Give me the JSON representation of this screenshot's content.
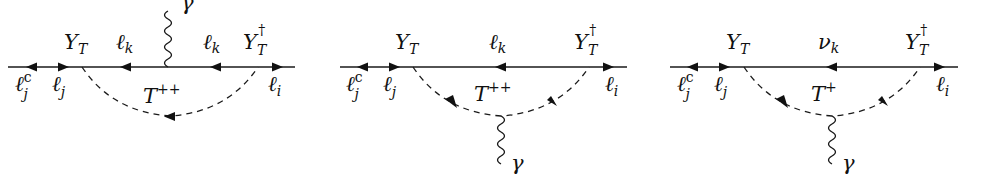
{
  "figure": {
    "colors": {
      "ink": "#111111",
      "background": "#ffffff"
    },
    "diagrams": [
      {
        "id": "diagram-1",
        "external_left_outer": {
          "base": "ℓ",
          "sup": "c",
          "sub": "j"
        },
        "external_left_inner": {
          "base": "ℓ",
          "sub": "j"
        },
        "external_right": {
          "base": "ℓ",
          "sub": "i"
        },
        "vertex_left": {
          "base": "Y",
          "sub": "T"
        },
        "vertex_right": {
          "base": "Y",
          "sub": "T",
          "sup": "†"
        },
        "internal_fermion_left": {
          "base": "ℓ",
          "sub": "k"
        },
        "internal_fermion_right": {
          "base": "ℓ",
          "sub": "k"
        },
        "scalar": {
          "base": "T",
          "sup": "++"
        },
        "photon": {
          "label": "γ",
          "attached_to": "internal fermion line (top)"
        }
      },
      {
        "id": "diagram-2",
        "external_left_outer": {
          "base": "ℓ",
          "sup": "c",
          "sub": "j"
        },
        "external_left_inner": {
          "base": "ℓ",
          "sub": "j"
        },
        "external_right": {
          "base": "ℓ",
          "sub": "i"
        },
        "vertex_left": {
          "base": "Y",
          "sub": "T"
        },
        "vertex_right": {
          "base": "Y",
          "sub": "T",
          "sup": "†"
        },
        "internal_fermion": {
          "base": "ℓ",
          "sub": "k"
        },
        "scalar": {
          "base": "T",
          "sup": "++"
        },
        "photon": {
          "label": "γ",
          "attached_to": "scalar line (bottom)"
        }
      },
      {
        "id": "diagram-3",
        "external_left_outer": {
          "base": "ℓ",
          "sup": "c",
          "sub": "j"
        },
        "external_left_inner": {
          "base": "ℓ",
          "sub": "j"
        },
        "external_right": {
          "base": "ℓ",
          "sub": "i"
        },
        "vertex_left": {
          "base": "Y",
          "sub": "T"
        },
        "vertex_right": {
          "base": "Y",
          "sub": "T",
          "sup": "†"
        },
        "internal_fermion": {
          "base": "ν",
          "sub": "k"
        },
        "scalar": {
          "base": "T",
          "sup": "+"
        },
        "photon": {
          "label": "γ",
          "attached_to": "scalar line (bottom)"
        }
      }
    ]
  }
}
